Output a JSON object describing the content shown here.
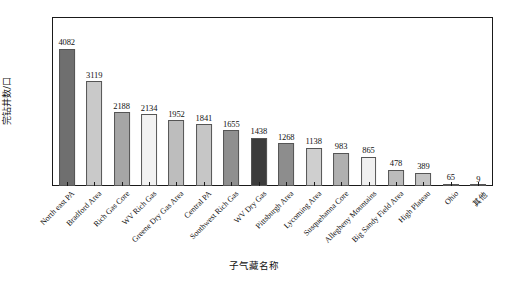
{
  "chart_data": {
    "type": "bar",
    "title": "",
    "xlabel": "子气藏名称",
    "ylabel": "完钻井数/口",
    "ylim": [
      0,
      5000
    ],
    "ytick_step": 1000,
    "ytick_labels": [
      "0",
      "1000",
      "2000",
      "3000",
      "4000",
      "5000"
    ],
    "grid": false,
    "legend": "none",
    "categories": [
      "North east PA",
      "Bradford Area",
      "Rich Gas Core",
      "WV Rich Gas",
      "Greene Dry Gas Area",
      "Central PA",
      "Southwest Rich Gas",
      "WV Dry Gas",
      "Pittsburgh Area",
      "Lycoming Area",
      "Susquehanna Core",
      "Allegheny Mountains",
      "Big Sandy Field Area",
      "High Plateau",
      "Ohio",
      "其他"
    ],
    "values": [
      4082,
      3119,
      2188,
      2134,
      1952,
      1841,
      1655,
      1438,
      1268,
      1138,
      983,
      865,
      478,
      389,
      65,
      9
    ],
    "bar_colors": [
      "#6f6f6f",
      "#c9c9c9",
      "#a6a6a6",
      "#f2f2f2",
      "#bdbdbd",
      "#c6c6c6",
      "#8f8f8f",
      "#3c3c3c",
      "#8d8d8d",
      "#cfcfcf",
      "#b0b0b0",
      "#f0f0f0",
      "#bcbcbc",
      "#c4c4c4",
      "#b5b5b5",
      "#ffffff"
    ],
    "axis_color": "#1a1a1a",
    "value_label_color": "#111111"
  }
}
